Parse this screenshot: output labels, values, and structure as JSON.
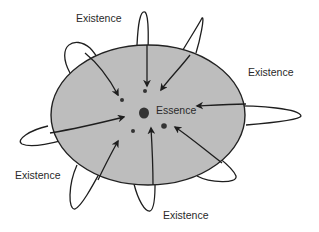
{
  "diagram": {
    "type": "concept-diagram",
    "ellipse": {
      "cx": 148,
      "cy": 115,
      "rx": 97,
      "ry": 70,
      "fill": "#bdbdbd",
      "stroke": "#222222"
    },
    "center": {
      "label": "Essence",
      "x": 145,
      "y": 112
    },
    "labels": [
      {
        "text": "Existence",
        "x": 76,
        "y": 12
      },
      {
        "text": "Existence",
        "x": 248,
        "y": 66
      },
      {
        "text": "Existence",
        "x": 15,
        "y": 169
      },
      {
        "text": "Existence",
        "x": 163,
        "y": 209
      }
    ],
    "dots": [
      {
        "x": 122,
        "y": 100,
        "r": 2
      },
      {
        "x": 145,
        "y": 91,
        "r": 2
      },
      {
        "x": 133,
        "y": 131,
        "r": 2
      },
      {
        "x": 164,
        "y": 126,
        "r": 2.8
      }
    ],
    "colors": {
      "stroke": "#1e1e1e",
      "text": "#2a2a2a",
      "background": "#ffffff"
    }
  }
}
